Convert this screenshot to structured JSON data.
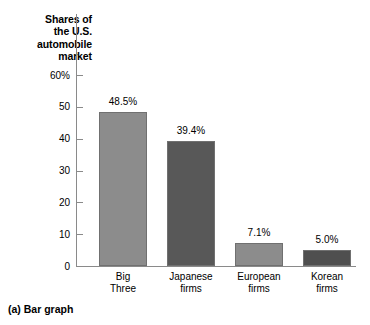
{
  "chart_data": {
    "type": "bar",
    "title": "Shares of the U.S. automobile market",
    "title_lines": [
      "Shares of",
      "the U.S.",
      "automobile",
      "market"
    ],
    "xlabel": "",
    "ylabel": "Shares of the U.S. automobile market",
    "ylim": [
      0,
      60
    ],
    "yticks": [
      0,
      10,
      20,
      30,
      40,
      50,
      60
    ],
    "ytick_labels": [
      "0",
      "10",
      "20",
      "30",
      "40",
      "50",
      "60%"
    ],
    "grid": false,
    "legend": "none",
    "categories": [
      "Big Three",
      "Japanese firms",
      "European firms",
      "Korean firms"
    ],
    "category_lines": [
      [
        "Big",
        "Three"
      ],
      [
        "Japanese",
        "firms"
      ],
      [
        "European",
        "firms"
      ],
      [
        "Korean",
        "firms"
      ]
    ],
    "values": [
      48.5,
      39.4,
      7.1,
      5.0
    ],
    "data_labels": [
      "48.5%",
      "39.4%",
      "7.1%",
      "5.0%"
    ],
    "bar_colors": [
      "#8c8c8c",
      "#585858",
      "#8c8c8c",
      "#4f4f4f"
    ],
    "bar_edge_color": "#707070",
    "axis_color": "#8a8a8a",
    "background": "#ffffff",
    "caption": "(a) Bar graph"
  }
}
